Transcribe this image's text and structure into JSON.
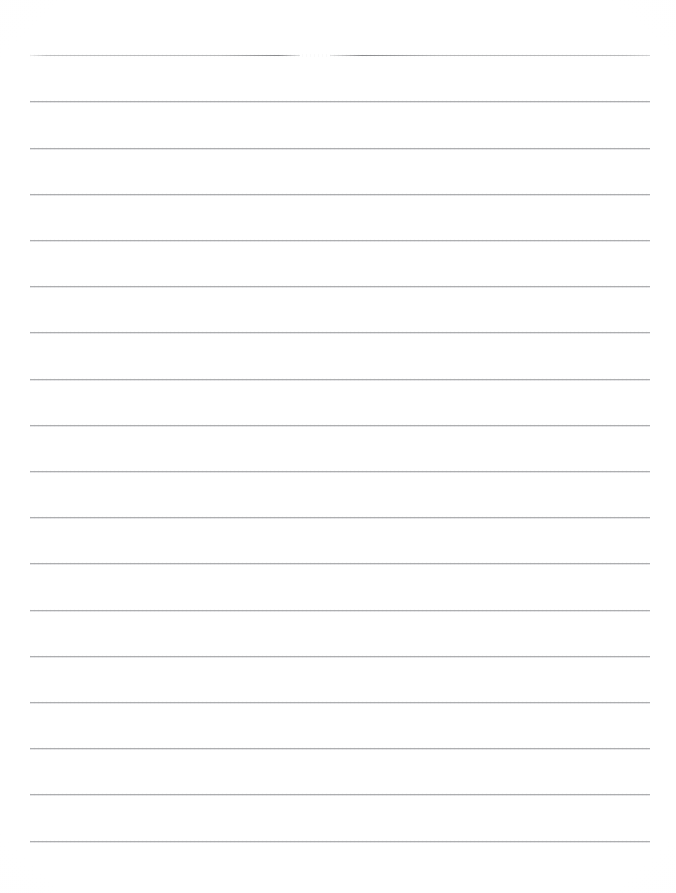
{
  "document": {
    "kind": "blank-lined-paper-scan",
    "page_width": 676,
    "page_height": 893,
    "background_color": "#ffffff",
    "rule_color": "#a8a9ab",
    "rule_thickness": 1,
    "rule_left": 30,
    "rule_right": 650,
    "first_rule_y": 55,
    "rule_spacing": 46.2,
    "rule_count": 18,
    "has_text": false,
    "text_content": "",
    "margin_rule": false,
    "holes": false,
    "rules": [
      {
        "index": 1,
        "y": 55,
        "left": 30,
        "right": 650,
        "broken": true,
        "segments": [
          {
            "left": 30,
            "right": 300
          },
          {
            "left": 330,
            "right": 650
          }
        ]
      },
      {
        "index": 2,
        "y": 101,
        "left": 30,
        "right": 650,
        "broken": false
      },
      {
        "index": 3,
        "y": 148,
        "left": 30,
        "right": 650,
        "broken": false
      },
      {
        "index": 4,
        "y": 194,
        "left": 30,
        "right": 650,
        "broken": false
      },
      {
        "index": 5,
        "y": 240,
        "left": 30,
        "right": 650,
        "broken": false
      },
      {
        "index": 6,
        "y": 286,
        "left": 30,
        "right": 650,
        "broken": false
      },
      {
        "index": 7,
        "y": 332,
        "left": 30,
        "right": 650,
        "broken": false
      },
      {
        "index": 8,
        "y": 379,
        "left": 30,
        "right": 650,
        "broken": false
      },
      {
        "index": 9,
        "y": 425,
        "left": 30,
        "right": 650,
        "broken": false
      },
      {
        "index": 10,
        "y": 471,
        "left": 30,
        "right": 650,
        "broken": false
      },
      {
        "index": 11,
        "y": 517,
        "left": 30,
        "right": 650,
        "broken": false
      },
      {
        "index": 12,
        "y": 563,
        "left": 30,
        "right": 650,
        "broken": false
      },
      {
        "index": 13,
        "y": 610,
        "left": 30,
        "right": 650,
        "broken": false
      },
      {
        "index": 14,
        "y": 656,
        "left": 30,
        "right": 650,
        "broken": false
      },
      {
        "index": 15,
        "y": 702,
        "left": 30,
        "right": 650,
        "broken": false
      },
      {
        "index": 16,
        "y": 748,
        "left": 30,
        "right": 650,
        "broken": false
      },
      {
        "index": 17,
        "y": 794,
        "left": 30,
        "right": 650,
        "broken": false
      },
      {
        "index": 18,
        "y": 841,
        "left": 30,
        "right": 650,
        "broken": false
      }
    ]
  }
}
